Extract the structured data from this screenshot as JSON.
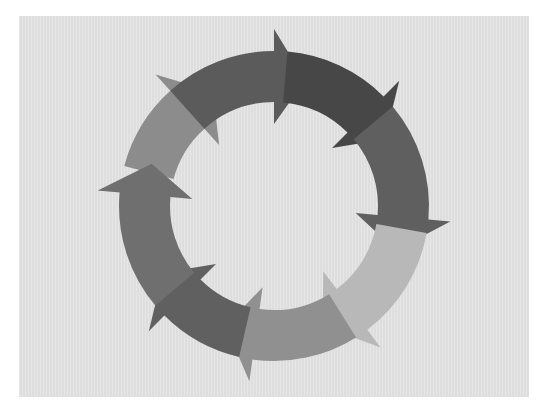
{
  "diagram": {
    "title": "Cycle diagram",
    "type": "circular-arrow-cycle",
    "direction": "clockwise",
    "background": "#e3e3e3",
    "center": [
      274,
      206
    ],
    "outer_radius": 155,
    "inner_radius": 104,
    "head_overhang": 22,
    "segments": [
      {
        "name": "segment-upper-left",
        "start": -75,
        "end": -42,
        "head": 14,
        "color": "#8c8c8c"
      },
      {
        "name": "segment-top",
        "start": -42,
        "end": 0,
        "head": 14,
        "color": "#5b5b5b"
      },
      {
        "name": "segment-upper-right",
        "start": 5,
        "end": 45,
        "head": 14,
        "color": "#474747"
      },
      {
        "name": "segment-right",
        "start": 50,
        "end": 95,
        "head": 15,
        "color": "#5f5f5f"
      },
      {
        "name": "segment-lower-right",
        "start": 100,
        "end": 143,
        "head": 15,
        "color": "#b8b8b8"
      },
      {
        "name": "segment-bottom",
        "start": 148,
        "end": 188,
        "head": 14,
        "color": "#909090"
      },
      {
        "name": "segment-lower-left",
        "start": 193,
        "end": 225,
        "head": 14,
        "color": "#606060"
      },
      {
        "name": "segment-left",
        "start": 230,
        "end": 275,
        "head": 14,
        "color": "#6f6f6f"
      }
    ]
  }
}
